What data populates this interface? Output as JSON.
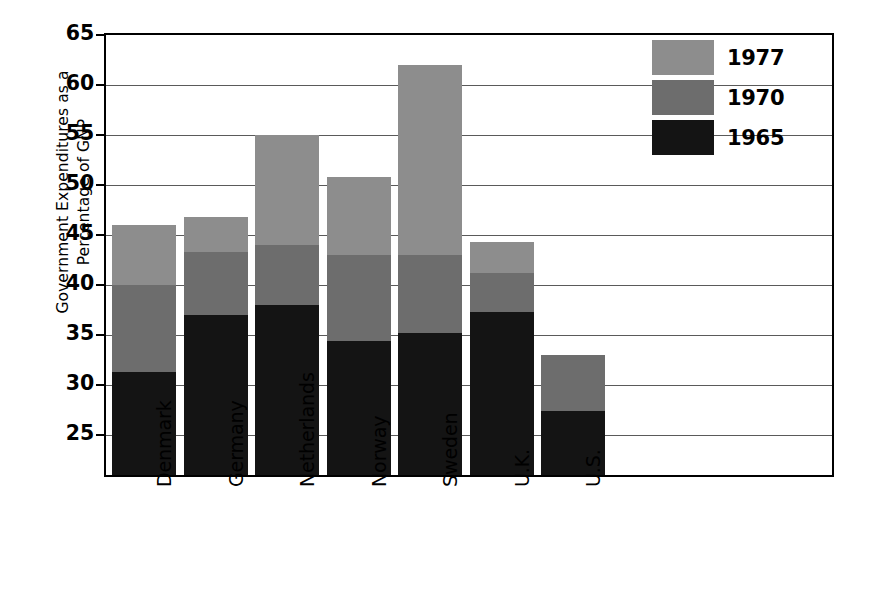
{
  "chart_data": {
    "type": "bar",
    "stacked": false,
    "overlapping_stacked": true,
    "title": "",
    "subtitle": "",
    "xlabel": "",
    "ylabel": "Government Expenditures as a Percentage of GNP",
    "ylabel_lines": [
      "Government Expenditures as a",
      "Percentage of GNP"
    ],
    "categories": [
      "Denmark",
      "Germany",
      "Netherlands",
      "Norway",
      "Sweden",
      "U.K.",
      "U.S."
    ],
    "series": [
      {
        "name": "1965",
        "color": "#141414",
        "values": [
          31.3,
          37.0,
          38.0,
          34.4,
          35.2,
          37.3,
          27.4
        ]
      },
      {
        "name": "1970",
        "color": "#6d6d6d",
        "values": [
          40.0,
          43.3,
          44.0,
          43.0,
          43.0,
          41.2,
          33.0
        ]
      },
      {
        "name": "1977",
        "color": "#8d8d8d",
        "values": [
          46.0,
          46.8,
          55.0,
          50.8,
          62.0,
          44.3,
          33.0
        ]
      }
    ],
    "ylim": [
      21,
      65
    ],
    "yticks": [
      25,
      30,
      35,
      40,
      45,
      50,
      55,
      60,
      65
    ],
    "ytick_labels": [
      "25",
      "30",
      "35",
      "40",
      "45",
      "50",
      "55",
      "60",
      "65"
    ],
    "grid": true,
    "grid_axis": "y",
    "legend_position": "top-right",
    "legend_order": [
      "1977",
      "1970",
      "1965"
    ]
  },
  "legend": {
    "items": [
      {
        "label": "1977",
        "color": "#8d8d8d"
      },
      {
        "label": "1970",
        "color": "#6d6d6d"
      },
      {
        "label": "1965",
        "color": "#141414"
      }
    ]
  },
  "axes": {
    "y_title_line1": "Government Expenditures as a",
    "y_title_line2": "Percentage of GNP",
    "y_ticks": [
      "65",
      "60",
      "55",
      "50",
      "45",
      "40",
      "35",
      "30",
      "25"
    ],
    "x_ticks": [
      "Denmark",
      "Germany",
      "Netherlands",
      "Norway",
      "Sweden",
      "U.K.",
      "U.S."
    ]
  }
}
